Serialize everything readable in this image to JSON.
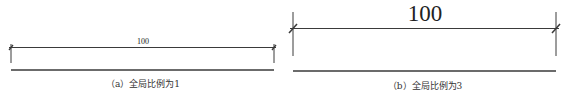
{
  "panels": [
    {
      "id": "a",
      "dimension_value": "100",
      "caption": "（a）全局比例为1",
      "global_scale": 1
    },
    {
      "id": "b",
      "dimension_value": "100",
      "caption": "（b）全局比例为3",
      "global_scale": 3
    }
  ],
  "colors": {
    "line": "#3a3a3a",
    "text": "#222222"
  }
}
